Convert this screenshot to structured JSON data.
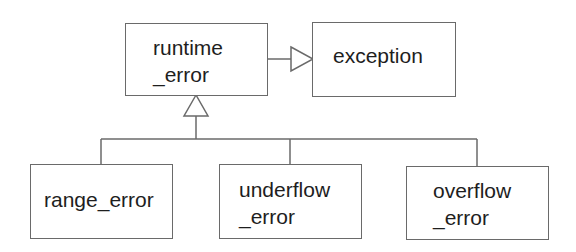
{
  "diagram": {
    "type": "uml-class-inheritance",
    "classes": [
      {
        "id": "runtime_error",
        "lines": [
          "runtime",
          "_error"
        ]
      },
      {
        "id": "exception",
        "lines": [
          "exception"
        ]
      },
      {
        "id": "range_error",
        "lines": [
          "range_error"
        ]
      },
      {
        "id": "underflow_error",
        "lines": [
          "underflow",
          "_error"
        ]
      },
      {
        "id": "overflow_error",
        "lines": [
          "overflow",
          "_error"
        ]
      }
    ],
    "relations": [
      {
        "from": "runtime_error",
        "to": "exception",
        "kind": "generalization"
      },
      {
        "from": "range_error",
        "to": "runtime_error",
        "kind": "generalization"
      },
      {
        "from": "underflow_error",
        "to": "runtime_error",
        "kind": "generalization"
      },
      {
        "from": "overflow_error",
        "to": "runtime_error",
        "kind": "generalization"
      }
    ],
    "colors": {
      "line": "#6a6a6a",
      "text": "#1e1e1e",
      "background": "#ffffff"
    }
  }
}
